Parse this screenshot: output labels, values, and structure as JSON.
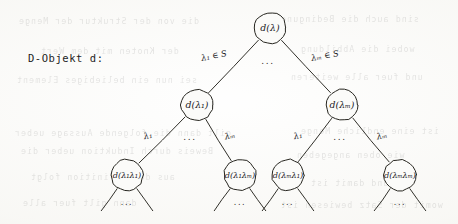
{
  "caption": {
    "text": "D-Objekt d:"
  },
  "diagram": {
    "kind": "handwritten-tree",
    "ink_color": "#26251f",
    "node_radius": 16,
    "ellipsis": "...",
    "nodes": [
      {
        "id": "root",
        "label": "d(λ)",
        "x": 270,
        "y": 28,
        "level": 0
      },
      {
        "id": "n1",
        "label": "d(λ₁)",
        "x": 197,
        "y": 105,
        "level": 1
      },
      {
        "id": "nm",
        "label": "d(λₘ)",
        "x": 342,
        "y": 105,
        "level": 1
      },
      {
        "id": "n11",
        "label": "d(λ₁λ₁)",
        "x": 127,
        "y": 175,
        "level": 2
      },
      {
        "id": "n1m",
        "label": "d(λ₁λₘ)",
        "x": 240,
        "y": 175,
        "level": 2
      },
      {
        "id": "nm1",
        "label": "d(λₘλ₁)",
        "x": 288,
        "y": 175,
        "level": 2
      },
      {
        "id": "nmm",
        "label": "d(λₘλₘ)",
        "x": 400,
        "y": 175,
        "level": 2
      }
    ],
    "edges": [
      {
        "id": "e-root-n1",
        "from": "root",
        "to": "n1",
        "label": "λ₁ ∈ S",
        "label_x": 214,
        "label_y": 56
      },
      {
        "id": "e-root-nm",
        "from": "root",
        "to": "nm",
        "label": "λₘ ∈ S",
        "label_x": 325,
        "label_y": 56
      },
      {
        "id": "e-n1-n11",
        "from": "n1",
        "to": "n11",
        "label": "λ₁",
        "label_x": 148,
        "label_y": 136
      },
      {
        "id": "e-n1-n1m",
        "from": "n1",
        "to": "n1m",
        "label": "λₘ",
        "label_x": 230,
        "label_y": 136
      },
      {
        "id": "e-nm-nm1",
        "from": "nm",
        "to": "nm1",
        "label": "λ₁",
        "label_x": 298,
        "label_y": 136
      },
      {
        "id": "e-nm-nmm",
        "from": "nm",
        "to": "nmm",
        "label": "λₘ",
        "label_x": 382,
        "label_y": 136
      }
    ],
    "branch_ellipses": [
      {
        "id": "ell-root",
        "text": "...",
        "x": 268,
        "y": 61
      },
      {
        "id": "ell-n1",
        "text": "...",
        "x": 190,
        "y": 137
      },
      {
        "id": "ell-nm",
        "text": "...",
        "x": 340,
        "y": 137
      }
    ],
    "leaf_stubs": [
      {
        "id": "stub-n11",
        "parent": "n11",
        "ellipsis": "...",
        "ellipsis_x": 127,
        "ellipsis_y": 202
      },
      {
        "id": "stub-n1m",
        "parent": "n1m",
        "ellipsis": "...",
        "ellipsis_x": 240,
        "ellipsis_y": 202
      },
      {
        "id": "stub-nm1",
        "parent": "nm1",
        "ellipsis": "...",
        "ellipsis_x": 288,
        "ellipsis_y": 202
      },
      {
        "id": "stub-nmm",
        "parent": "nmm",
        "ellipsis": "...",
        "ellipsis_x": 400,
        "ellipsis_y": 202
      }
    ]
  },
  "bleed_through": {
    "note": "faint mirrored text showing through from the reverse of the scanned page",
    "lines": [
      {
        "text": "die von der Struktur der Menge",
        "x": 18,
        "y": 16
      },
      {
        "text": "sind auch die Bedingungen",
        "x": 268,
        "y": 14
      },
      {
        "text": "der Knoten mit dem Wert",
        "x": 40,
        "y": 46
      },
      {
        "text": "wobei die Abbildung",
        "x": 300,
        "y": 44
      },
      {
        "text": "sei nun ein beliebiges Element",
        "x": 16,
        "y": 75
      },
      {
        "text": "und fuer alle weiteren",
        "x": 290,
        "y": 72
      },
      {
        "text": "gilt dann die folgende Aussage ueber",
        "x": 14,
        "y": 128
      },
      {
        "text": "ist eine endliche Menge",
        "x": 300,
        "y": 126
      },
      {
        "text": "Beweis durch Induktion ueber die",
        "x": 20,
        "y": 146
      },
      {
        "text": "wie oben angegeben",
        "x": 296,
        "y": 150
      },
      {
        "text": "aus der Definition folgt",
        "x": 30,
        "y": 172
      },
      {
        "text": "und damit ist",
        "x": 310,
        "y": 178
      },
      {
        "text": "dann gilt fuer alle",
        "x": 22,
        "y": 198
      },
      {
        "text": "womit der Satz bewiesen ist",
        "x": 280,
        "y": 200
      }
    ]
  }
}
